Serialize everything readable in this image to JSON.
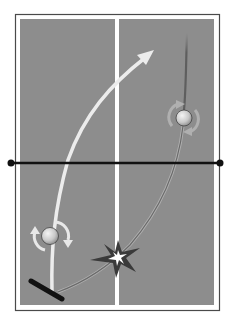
{
  "diagram": {
    "colors": {
      "background": "#ffffff",
      "table_surface": "#8d8d8d",
      "table_lines": "#ffffff",
      "outer_border": "#4a4a4a",
      "net": "#111111",
      "outgoing_arrow": "#ececec",
      "incoming_path": "#6f6f6f",
      "ball": "#d6d6d6",
      "paddle": "#111111",
      "impact": "#3a3a3a"
    },
    "elements": {
      "table": "table-surface",
      "net": "net-line",
      "center_line": "center-line",
      "outgoing_shot": "white-arrow-trajectory",
      "incoming_shot": "dark-curved-trajectory",
      "ball_near": "ball-with-spin-arrows",
      "ball_far": "ball-with-spin-arrows",
      "paddle": "paddle",
      "impact": "bounce-impact-star"
    },
    "labels": []
  }
}
